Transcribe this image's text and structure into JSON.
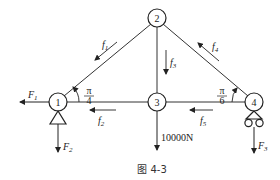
{
  "diagram": {
    "caption": "图 4-3",
    "nodes": [
      {
        "id": "1",
        "label": "1",
        "x": 58,
        "y": 102,
        "support": "pin"
      },
      {
        "id": "2",
        "label": "2",
        "x": 157,
        "y": 18,
        "support": "none"
      },
      {
        "id": "3",
        "label": "3",
        "x": 157,
        "y": 102,
        "support": "none"
      },
      {
        "id": "4",
        "label": "4",
        "x": 254,
        "y": 102,
        "support": "roller"
      }
    ],
    "members": [
      {
        "from": "1",
        "to": "2",
        "force": "f1"
      },
      {
        "from": "1",
        "to": "3",
        "force": "f2"
      },
      {
        "from": "2",
        "to": "3",
        "force": "f3"
      },
      {
        "from": "2",
        "to": "4",
        "force": "f4"
      },
      {
        "from": "3",
        "to": "4",
        "force": "f5"
      }
    ],
    "member_forces": {
      "f1": {
        "name": "f",
        "sub": "1"
      },
      "f2": {
        "name": "f",
        "sub": "2"
      },
      "f3": {
        "name": "f",
        "sub": "3"
      },
      "f4": {
        "name": "f",
        "sub": "4"
      },
      "f5": {
        "name": "f",
        "sub": "5"
      }
    },
    "external_forces": {
      "F1": {
        "name": "F",
        "sub": "1",
        "node": "1",
        "direction": "left"
      },
      "F2": {
        "name": "F",
        "sub": "2",
        "node": "1",
        "direction": "down"
      },
      "F3": {
        "name": "F",
        "sub": "3",
        "node": "4",
        "direction": "down"
      },
      "load": {
        "label": "10000N",
        "node": "3",
        "direction": "down"
      }
    },
    "angles": {
      "left": {
        "num": "π",
        "den": "4",
        "node": "1"
      },
      "right": {
        "num": "π",
        "den": "6",
        "node": "4"
      }
    }
  }
}
